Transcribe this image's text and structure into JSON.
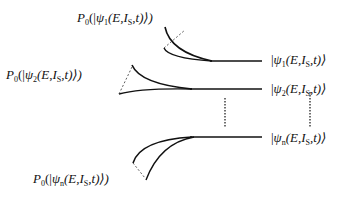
{
  "diagram": {
    "projection_labels": [
      {
        "id": "p1",
        "text": "P₀(|ψ₁(E,I_S,t)⟩)",
        "base": "P",
        "base_sub": "0",
        "psi": "ψ",
        "psi_sub": "1",
        "args": "(E,I",
        "args_sub": "S",
        "tail": ",t)⟩)"
      },
      {
        "id": "p2",
        "text": "P₀(|ψ₂(E,I_S,t)⟩)",
        "base": "P",
        "base_sub": "0",
        "psi": "ψ",
        "psi_sub": "2",
        "args": "(E,I",
        "args_sub": "S",
        "tail": ",t)⟩)"
      },
      {
        "id": "pn",
        "text": "P₀(|ψₙ(E,I_S,t)⟩)",
        "base": "P",
        "base_sub": "0",
        "psi": "ψ",
        "psi_sub": "n",
        "args": "(E,I",
        "args_sub": "S",
        "tail": ",t)⟩)"
      }
    ],
    "state_labels": [
      {
        "id": "s1",
        "text": "|ψ₁(E,I_S,t)⟩",
        "psi": "ψ",
        "psi_sub": "1",
        "args": "(E,I",
        "args_sub": "S",
        "tail": ",t)⟩"
      },
      {
        "id": "s2",
        "text": "|ψ₂(E,I_S,t)⟩",
        "psi": "ψ",
        "psi_sub": "2",
        "args": "(E,I",
        "args_sub": "S",
        "tail": ",t)⟩"
      },
      {
        "id": "sn",
        "text": "|ψₙ(E,I_S,t)⟩",
        "psi": "ψ",
        "psi_sub": "n",
        "args": "(E,I",
        "args_sub": "S",
        "tail": ",t)⟩"
      }
    ],
    "open_paren": "(",
    "bar": "|",
    "ellipsis": "vertical dots"
  }
}
